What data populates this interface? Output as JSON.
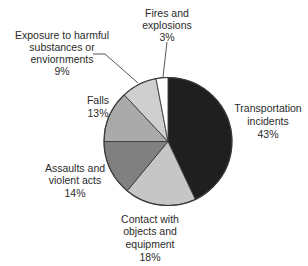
{
  "chart_data": {
    "type": "pie",
    "title": "",
    "start_angle_deg": 0,
    "direction": "clockwise",
    "categories": [
      "Transportation incidents",
      "Contact with objects and equipment",
      "Assaults and violent acts",
      "Falls",
      "Exposure to harmful substances or enviornments",
      "Fires and explosions"
    ],
    "values": [
      43,
      18,
      14,
      13,
      9,
      3
    ],
    "unit": "%",
    "colors": [
      "#1f1f1f",
      "#c6c6c6",
      "#808080",
      "#aaaaaa",
      "#cfcfcf",
      "#ffffff"
    ],
    "slices": [
      {
        "lines": [
          "Transportation",
          "incidents",
          "43%"
        ],
        "x": 268,
        "ys": [
          108,
          121,
          134
        ],
        "anchor": "middle"
      },
      {
        "lines": [
          "Contact with",
          "objects and",
          "equipment",
          "18%"
        ],
        "x": 150,
        "ys": [
          219,
          231,
          244,
          257
        ],
        "anchor": "middle"
      },
      {
        "lines": [
          "Assaults and",
          "violent acts",
          "14%"
        ],
        "x": 75,
        "ys": [
          168,
          180,
          193
        ],
        "anchor": "middle"
      },
      {
        "lines": [
          "Falls",
          "13%"
        ],
        "x": 98,
        "ys": [
          100,
          113
        ],
        "anchor": "middle"
      },
      {
        "lines": [
          "Exposure to harmful",
          "substances or",
          "enviornments",
          "9%"
        ],
        "x": 62,
        "ys": [
          35,
          47,
          59,
          71
        ],
        "anchor": "middle"
      },
      {
        "lines": [
          "Fires and",
          "explosions",
          "3%"
        ],
        "x": 167,
        "ys": [
          13,
          25,
          37
        ],
        "anchor": "middle"
      }
    ],
    "leader_lines": [
      {
        "slice": 4,
        "points": [
          [
            93,
            54
          ],
          [
            105,
            54
          ],
          [
            138,
            83
          ]
        ]
      },
      {
        "slice": 5,
        "points": [
          [
            167,
            42
          ],
          [
            163,
            77
          ]
        ]
      }
    ],
    "geometry": {
      "cx": 168,
      "cy": 141.5,
      "r": 64
    },
    "stroke_color": "#3a3a3a"
  }
}
